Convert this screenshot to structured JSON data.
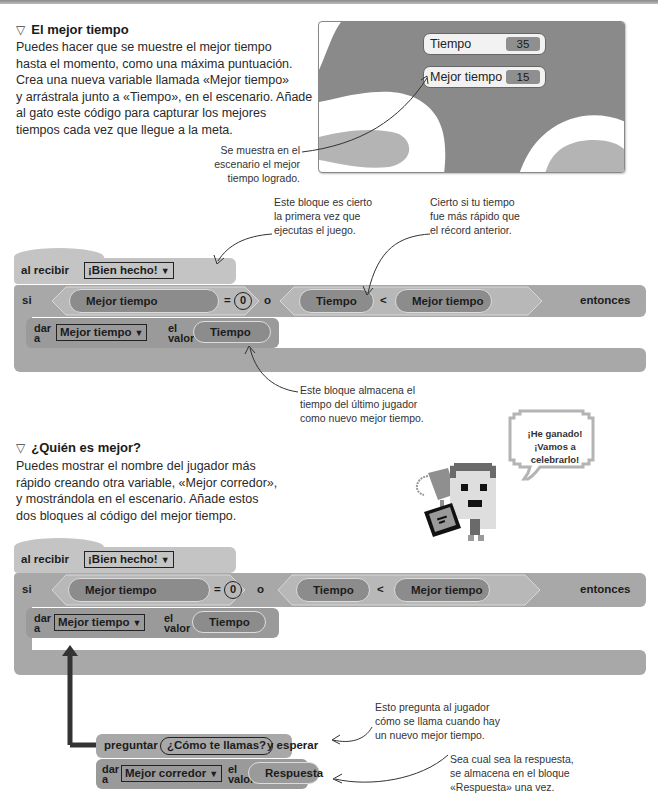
{
  "section1": {
    "icon": "triangle-down-icon",
    "title": "El mejor tiempo",
    "paragraph": [
      "Puedes hacer que se muestre el mejor tiempo",
      "hasta el momento, como una máxima puntuación.",
      "Crea una nueva variable llamada «Mejor tiempo»",
      "y arrástrala junto a «Tiempo», en el escenario. Añade",
      "al gato este código para capturar los mejores",
      "tiempos cada vez que llegue a la meta."
    ],
    "stage_note": [
      "Se muestra en el",
      "escenario el mejor",
      "tiempo logrado."
    ]
  },
  "stage": {
    "monitors": [
      {
        "label": "Tiempo",
        "value": "35"
      },
      {
        "label": "Mejor tiempo",
        "value": "15"
      }
    ]
  },
  "script1": {
    "hat_label": "al recibir",
    "hat_message": "¡Bien hecho!",
    "if_label": "si",
    "then_label": "entonces",
    "cond_left_var": "Mejor tiempo",
    "equals_op": "=",
    "equals_value": "0",
    "or_label": "o",
    "cond_right_left": "Tiempo",
    "less_op": "<",
    "cond_right_right": "Mejor tiempo",
    "set_label_top": "dar",
    "set_label_bottom": "a",
    "set_var": "Mejor tiempo",
    "set_value_top": "el",
    "set_value_bottom": "valor",
    "set_value": "Tiempo",
    "dropdown_arrow": "▼"
  },
  "notes1": {
    "first_run": [
      "Este bloque es cierto",
      "la primera vez que",
      "ejecutas el juego."
    ],
    "faster": [
      "Cierto si tu tiempo",
      "fue más rápido que",
      "el récord anterior."
    ],
    "stores": [
      "Este bloque almacena el",
      "tiempo del último jugador",
      "como nuevo mejor tiempo."
    ]
  },
  "section2": {
    "icon": "triangle-down-icon",
    "title": "¿Quién es mejor?",
    "paragraph": [
      "Puedes mostrar el nombre del jugador más",
      "rápido creando otra variable, «Mejor corredor»,",
      "y mostrándola en el escenario. Añade estos",
      "dos bloques al código del mejor tiempo."
    ],
    "speech": [
      "¡He ganado!",
      "¡Vamos a celebrarlo!"
    ]
  },
  "script2": {
    "hat_label": "al recibir",
    "hat_message": "¡Bien hecho!",
    "if_label": "si",
    "then_label": "entonces",
    "cond_left_var": "Mejor tiempo",
    "equals_op": "=",
    "equals_value": "0",
    "or_label": "o",
    "cond_right_left": "Tiempo",
    "less_op": "<",
    "cond_right_right": "Mejor tiempo",
    "set_label_top": "dar",
    "set_label_bottom": "a",
    "set_var": "Mejor tiempo",
    "set_value_top": "el",
    "set_value_bottom": "valor",
    "set_value": "Tiempo",
    "ask_label": "preguntar",
    "ask_input": "¿Cómo te llamas?",
    "ask_wait": "y esperar",
    "set2_var": "Mejor corredor",
    "set2_value": "Respuesta",
    "dropdown_arrow": "▼"
  },
  "notes2": {
    "asks": [
      "Esto pregunta al jugador",
      "cómo se llama cuando hay",
      "un nuevo mejor tiempo."
    ],
    "answer": [
      "Sea cual sea la respuesta,",
      "se almacena en el bloque",
      "«Respuesta» una vez."
    ]
  }
}
